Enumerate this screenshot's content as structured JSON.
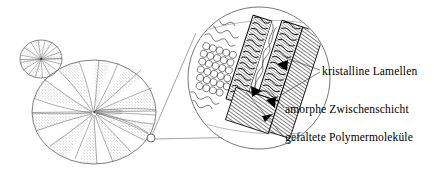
{
  "figure": {
    "language": "de",
    "background_color": "#ffffff",
    "line_color": "#000000",
    "stipple_color": "#8a8a8a",
    "width": 447,
    "height": 171
  },
  "labels": {
    "crystalline_lamellae": "kristalline Lamellen",
    "amorphous_interlayer": "amorphe Zwischenschicht",
    "folded_polymer_molecules": "gefaltete Polymermoleküle"
  },
  "diagram": {
    "small_spherulite": {
      "name": "kleiner Spherulith",
      "cx": 41,
      "cy": 59,
      "rx": 21,
      "ry": 19,
      "sectors": 20
    },
    "large_spherulite": {
      "name": "großer Spherulith",
      "cx": 94,
      "cy": 112,
      "rx": 62,
      "ry": 52,
      "sectors": 22
    },
    "callout_marker": {
      "name": "Ausschnittsmarkierung",
      "cx": 151,
      "cy": 138,
      "r": 4
    },
    "magnifier": {
      "name": "Vergrößerungskreis",
      "cx": 259,
      "cy": 78,
      "r": 71,
      "lamella_bands": 4,
      "fold_loop_rows": 7
    },
    "leader_lines": [
      {
        "from_label": "crystalline_lamellae",
        "to_x": 272,
        "to_y": 63
      },
      {
        "from_label": "crystalline_lamellae",
        "to_x": 251,
        "to_y": 88
      },
      {
        "from_label": "amorphous_interlayer",
        "to_x": 262,
        "to_y": 93
      },
      {
        "from_label": "folded_polymer_molecules",
        "to_x": 243,
        "to_y": 58
      }
    ],
    "arrowheads": 4
  }
}
